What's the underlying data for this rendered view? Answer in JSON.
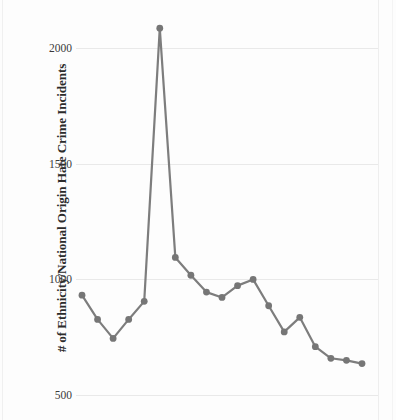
{
  "chart_data": {
    "type": "line",
    "title": "",
    "xlabel": "",
    "ylabel": "# of Ethnicity/National Origin Hate Crime Incidents",
    "ylim": [
      470,
      2130
    ],
    "yticks": [
      500,
      1000,
      1500,
      2000
    ],
    "ytick_labels": [
      "500",
      "1000",
      "1500",
      "2000"
    ],
    "grid": true,
    "legend": "none",
    "series": [
      {
        "name": "Ethnicity/National Origin Hate Crime Incidents",
        "color": "#7d7d7d",
        "marker": "circle",
        "values": [
          932,
          827,
          745,
          827,
          905,
          2086,
          1095,
          1018,
          945,
          922,
          973,
          1000,
          886,
          773,
          836,
          709,
          659,
          650,
          636
        ]
      }
    ],
    "x": [
      0,
      1,
      2,
      3,
      4,
      5,
      6,
      7,
      8,
      9,
      10,
      11,
      12,
      13,
      14,
      15,
      16,
      17,
      18
    ],
    "xtick_labels": [],
    "point_count": 19
  },
  "axis": {
    "y_title": "# of Ethnicity/National Origin Hate Crime Incidents"
  },
  "colors": {
    "line": "#7d7d7d",
    "marker": "#767676",
    "gridline": "#e9e9e9",
    "text": "#2b2b2b",
    "background": "#fdfdfd"
  }
}
